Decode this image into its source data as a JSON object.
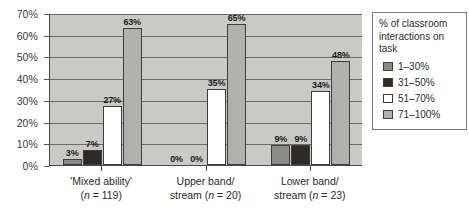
{
  "chart_data": {
    "type": "bar",
    "title": "",
    "xlabel": "",
    "ylabel": "",
    "ylim": [
      0,
      70
    ],
    "ytick_labels": [
      "0%",
      "10%",
      "20%",
      "30%",
      "40%",
      "50%",
      "60%",
      "70%"
    ],
    "ytick_values": [
      0,
      10,
      20,
      30,
      40,
      50,
      60,
      70
    ],
    "grid": true,
    "legend_position": "right",
    "categories": [
      "'Mixed ability'",
      "Upper band/ stream",
      "Lower band/ stream"
    ],
    "category_lines": [
      {
        "line1": "'Mixed ability'",
        "line2": "(n = 119)",
        "n": 119
      },
      {
        "line1": "Upper band/",
        "line2": "stream (n = 20)",
        "n": 20
      },
      {
        "line1": "Lower band/",
        "line2": "stream (n = 23)",
        "n": 23
      }
    ],
    "series": [
      {
        "name": "1–30%",
        "color": "#8a8a87",
        "values": [
          3,
          0,
          9
        ],
        "labels": [
          "3%",
          "0%",
          "9%"
        ]
      },
      {
        "name": "31–50%",
        "color": "#2f2a26",
        "values": [
          7,
          0,
          9
        ],
        "labels": [
          "7%",
          "0%",
          "9%"
        ]
      },
      {
        "name": "51–70%",
        "color": "#ffffff",
        "values": [
          27,
          35,
          34
        ],
        "labels": [
          "27%",
          "35%",
          "34%"
        ]
      },
      {
        "name": "71–100%",
        "color": "#b0b0ad",
        "values": [
          63,
          65,
          48
        ],
        "labels": [
          "63%",
          "65%",
          "48%"
        ]
      }
    ]
  },
  "legend": {
    "title": "% of classroom interactions on task",
    "items": [
      {
        "label": "1–30%",
        "color": "#8a8a87"
      },
      {
        "label": "31–50%",
        "color": "#2f2a26"
      },
      {
        "label": "51–70%",
        "color": "#ffffff"
      },
      {
        "label": "71–100%",
        "color": "#b0b0ad"
      }
    ]
  },
  "colors": {
    "plot_background": "#c9c9c6",
    "gridline": "#6c6c6a",
    "axis": "#4a4a4a",
    "page_background": "#ffffff"
  }
}
